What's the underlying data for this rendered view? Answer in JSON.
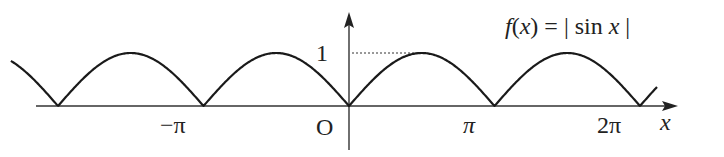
{
  "title": "f(x) = | sin x |",
  "function_label": {
    "f": "f",
    "open": "(",
    "x": "x",
    "close": ")",
    "eq": " = ",
    "bar1": "|",
    "sin": " sin ",
    "arg": "x",
    "bar2": " |"
  },
  "axes": {
    "x_label": "x",
    "origin_label": "O",
    "y_tick_label": "1",
    "x_tick_labels": [
      "−π",
      "π",
      "2π"
    ]
  },
  "chart_data": {
    "type": "line",
    "title": "f(x) = | sin x |",
    "xlabel": "x",
    "ylabel": "",
    "x_ticks": [
      "−π",
      "O",
      "π",
      "2π"
    ],
    "y_ticks": [
      "1"
    ],
    "xlim": [
      -7.3,
      7.0
    ],
    "ylim": [
      0,
      1
    ],
    "series": [
      {
        "name": "|sin x|",
        "function": "abs(sin(x))",
        "zeros": [
          -6.283,
          -3.1416,
          0,
          3.1416,
          6.283
        ],
        "max": 1
      }
    ],
    "annotations": [
      "dotted line at y=1 from y-axis to peak at x=π/2"
    ],
    "grid": false
  },
  "colors": {
    "curve": "#1a1a1a",
    "axis": "#333333"
  }
}
